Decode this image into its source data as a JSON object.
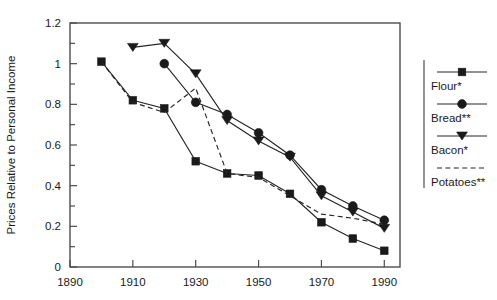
{
  "chart_data": {
    "type": "line",
    "title": "",
    "xlabel": "",
    "ylabel": "Prices Relative to Personal Income",
    "xlim": [
      1890,
      1995
    ],
    "ylim": [
      0,
      1.2
    ],
    "xticks": [
      1890,
      1910,
      1930,
      1950,
      1970,
      1990
    ],
    "xticklabels": [
      "1890",
      "1910",
      "1930",
      "1950",
      "1970",
      "1990"
    ],
    "yticks": [
      0,
      0.2,
      0.4,
      0.6,
      0.8,
      1,
      1.2
    ],
    "yticklabels": [
      "0",
      "0.2",
      "0.4",
      "0.6",
      "0.8",
      "1",
      "1.2"
    ],
    "yminorticks": [
      0.1,
      0.3,
      0.5,
      0.7,
      0.9,
      1.1
    ],
    "grid": false,
    "legend_position": "right",
    "series": [
      {
        "name": "Flour*",
        "marker": "square",
        "linestyle": "solid",
        "color": "#1a1a1a",
        "x": [
          1900,
          1910,
          1920,
          1930,
          1940,
          1950,
          1960,
          1970,
          1980,
          1990
        ],
        "y": [
          1.01,
          0.82,
          0.78,
          0.52,
          0.46,
          0.45,
          0.36,
          0.22,
          0.14,
          0.08
        ]
      },
      {
        "name": "Bread**",
        "marker": "circle",
        "linestyle": "solid",
        "color": "#1a1a1a",
        "x": [
          1920,
          1930,
          1940,
          1950,
          1960,
          1970,
          1980,
          1990
        ],
        "y": [
          1.0,
          0.81,
          0.75,
          0.66,
          0.55,
          0.38,
          0.3,
          0.23
        ]
      },
      {
        "name": "Bacon*",
        "marker": "triangle-down",
        "linestyle": "solid",
        "color": "#1a1a1a",
        "x": [
          1910,
          1920,
          1930,
          1940,
          1950,
          1960,
          1970,
          1980,
          1990
        ],
        "y": [
          1.08,
          1.1,
          0.95,
          0.72,
          0.62,
          0.54,
          0.35,
          0.27,
          0.19
        ]
      },
      {
        "name": "Potatoes**",
        "marker": "none",
        "linestyle": "dashed",
        "color": "#4d4d4d",
        "x": [
          1900,
          1910,
          1920,
          1930,
          1940,
          1950,
          1960,
          1970,
          1980,
          1990
        ],
        "y": [
          1.01,
          0.81,
          0.76,
          0.88,
          0.46,
          0.44,
          0.35,
          0.26,
          0.24,
          0.21
        ]
      }
    ]
  },
  "legend": {
    "items": [
      {
        "label": "Flour*",
        "marker": "square",
        "linestyle": "solid"
      },
      {
        "label": "Bread**",
        "marker": "circle",
        "linestyle": "solid"
      },
      {
        "label": "Bacon*",
        "marker": "triangle-down",
        "linestyle": "solid"
      },
      {
        "label": "Potatoes**",
        "marker": "none",
        "linestyle": "dashed"
      }
    ]
  }
}
